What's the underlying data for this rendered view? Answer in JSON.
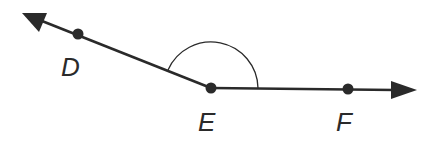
{
  "diagram": {
    "type": "angle",
    "colors": {
      "stroke": "#2a2a2a",
      "background": "#ffffff"
    },
    "points": [
      {
        "id": "D",
        "label": "D",
        "x": 78,
        "y": 34
      },
      {
        "id": "E",
        "label": "E",
        "x": 211,
        "y": 88
      },
      {
        "id": "F",
        "label": "F",
        "x": 348,
        "y": 89
      }
    ],
    "rays": [
      {
        "from": "E",
        "through": "D",
        "arrow_tip": [
          22,
          13
        ]
      },
      {
        "from": "E",
        "through": "F",
        "arrow_tip": [
          417,
          90
        ]
      }
    ],
    "angle_arc": {
      "vertex": "E",
      "radius": 47
    }
  }
}
